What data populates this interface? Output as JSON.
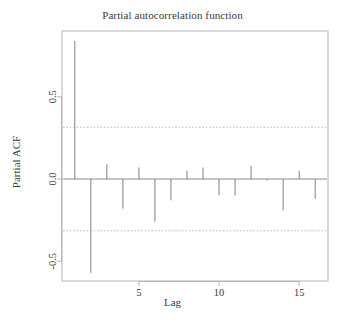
{
  "chart_data": {
    "type": "bar",
    "title": "Partial autocorrelation function",
    "xlabel": "Lag",
    "ylabel": "Partial ACF",
    "grid": false,
    "legend": null,
    "x": [
      1,
      2,
      3,
      4,
      5,
      6,
      7,
      8,
      9,
      10,
      11,
      12,
      13,
      14,
      15,
      16
    ],
    "categories": [
      "1",
      "2",
      "3",
      "4",
      "5",
      "6",
      "7",
      "8",
      "9",
      "10",
      "11",
      "12",
      "13",
      "14",
      "15",
      "16"
    ],
    "values": [
      0.84,
      -0.57,
      0.09,
      -0.18,
      0.07,
      -0.26,
      -0.13,
      0.05,
      0.07,
      -0.1,
      -0.1,
      0.08,
      -0.01,
      -0.19,
      0.05,
      -0.12
    ],
    "xlim": [
      0.2,
      16.8
    ],
    "ylim": [
      -0.62,
      0.9
    ],
    "xticks": [
      5,
      10,
      15
    ],
    "xtick_labels": [
      "5",
      "10",
      "15"
    ],
    "yticks": [
      -0.5,
      0.0,
      0.5
    ],
    "ytick_labels": [
      "-0.5",
      "0.0",
      "0.5"
    ],
    "zero_line": 0.0,
    "confidence_bands": [
      0.315,
      -0.315
    ],
    "confidence_style": "dashed",
    "colors": {
      "spike": "#808080",
      "axis": "#8c8c8c",
      "frame": "#b4b4b4",
      "confidence": "#bdbdbd",
      "text": "#3a3a3a",
      "background": "#ffffff"
    }
  }
}
